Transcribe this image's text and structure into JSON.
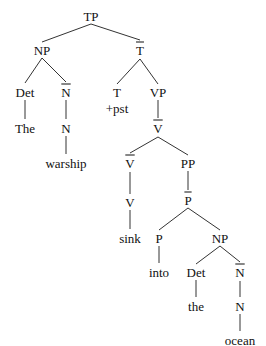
{
  "diagram": {
    "type": "syntax-tree",
    "sentence": "The warship sink +pst into the ocean",
    "nodes": [
      {
        "id": "tp",
        "label": "TP",
        "bar": false,
        "x": 91,
        "y": 16
      },
      {
        "id": "np1",
        "label": "NP",
        "bar": false,
        "x": 42,
        "y": 50
      },
      {
        "id": "tbar",
        "label": "T",
        "bar": true,
        "x": 140,
        "y": 50
      },
      {
        "id": "det1",
        "label": "Det",
        "bar": false,
        "x": 25,
        "y": 92
      },
      {
        "id": "nbar1",
        "label": "N",
        "bar": true,
        "x": 66,
        "y": 92
      },
      {
        "id": "t",
        "label": "T",
        "bar": false,
        "x": 117,
        "y": 92
      },
      {
        "id": "pst",
        "label": "+pst",
        "bar": false,
        "x": 117,
        "y": 108
      },
      {
        "id": "vp",
        "label": "VP",
        "bar": false,
        "x": 158,
        "y": 92
      },
      {
        "id": "the1",
        "label": "The",
        "bar": false,
        "x": 25,
        "y": 128
      },
      {
        "id": "n1",
        "label": "N",
        "bar": false,
        "x": 66,
        "y": 128
      },
      {
        "id": "vbar1",
        "label": "V",
        "bar": true,
        "x": 158,
        "y": 128
      },
      {
        "id": "warship",
        "label": "warship",
        "bar": false,
        "x": 66,
        "y": 163
      },
      {
        "id": "vbar2",
        "label": "V",
        "bar": true,
        "x": 130,
        "y": 163
      },
      {
        "id": "pp",
        "label": "PP",
        "bar": false,
        "x": 188,
        "y": 163
      },
      {
        "id": "v",
        "label": "V",
        "bar": false,
        "x": 130,
        "y": 202
      },
      {
        "id": "pbar",
        "label": "P",
        "bar": true,
        "x": 188,
        "y": 200
      },
      {
        "id": "sink",
        "label": "sink",
        "bar": false,
        "x": 130,
        "y": 238
      },
      {
        "id": "p",
        "label": "P",
        "bar": false,
        "x": 159,
        "y": 238
      },
      {
        "id": "np2",
        "label": "NP",
        "bar": false,
        "x": 220,
        "y": 238
      },
      {
        "id": "into",
        "label": "into",
        "bar": false,
        "x": 159,
        "y": 272
      },
      {
        "id": "det2",
        "label": "Det",
        "bar": false,
        "x": 196,
        "y": 272
      },
      {
        "id": "nbar2",
        "label": "N",
        "bar": true,
        "x": 240,
        "y": 272
      },
      {
        "id": "the2",
        "label": "the",
        "bar": false,
        "x": 196,
        "y": 306
      },
      {
        "id": "n2",
        "label": "N",
        "bar": false,
        "x": 240,
        "y": 306
      },
      {
        "id": "ocean",
        "label": "ocean",
        "bar": false,
        "x": 240,
        "y": 340
      }
    ],
    "edges": [
      {
        "x1": 91,
        "y1": 24,
        "x2": 42,
        "y2": 42
      },
      {
        "x1": 91,
        "y1": 24,
        "x2": 140,
        "y2": 40
      },
      {
        "x1": 42,
        "y1": 58,
        "x2": 25,
        "y2": 83
      },
      {
        "x1": 42,
        "y1": 58,
        "x2": 66,
        "y2": 82
      },
      {
        "x1": 140,
        "y1": 59,
        "x2": 117,
        "y2": 84
      },
      {
        "x1": 140,
        "y1": 59,
        "x2": 158,
        "y2": 84
      },
      {
        "x1": 25,
        "y1": 100,
        "x2": 25,
        "y2": 119
      },
      {
        "x1": 66,
        "y1": 100,
        "x2": 66,
        "y2": 119
      },
      {
        "x1": 158,
        "y1": 100,
        "x2": 158,
        "y2": 118
      },
      {
        "x1": 66,
        "y1": 136,
        "x2": 66,
        "y2": 154
      },
      {
        "x1": 158,
        "y1": 137,
        "x2": 130,
        "y2": 153
      },
      {
        "x1": 158,
        "y1": 137,
        "x2": 188,
        "y2": 155
      },
      {
        "x1": 130,
        "y1": 172,
        "x2": 130,
        "y2": 194
      },
      {
        "x1": 188,
        "y1": 171,
        "x2": 188,
        "y2": 190
      },
      {
        "x1": 130,
        "y1": 210,
        "x2": 130,
        "y2": 229
      },
      {
        "x1": 188,
        "y1": 208,
        "x2": 159,
        "y2": 230
      },
      {
        "x1": 188,
        "y1": 208,
        "x2": 220,
        "y2": 230
      },
      {
        "x1": 159,
        "y1": 246,
        "x2": 159,
        "y2": 263
      },
      {
        "x1": 220,
        "y1": 246,
        "x2": 196,
        "y2": 264
      },
      {
        "x1": 220,
        "y1": 246,
        "x2": 240,
        "y2": 262
      },
      {
        "x1": 196,
        "y1": 280,
        "x2": 196,
        "y2": 297
      },
      {
        "x1": 240,
        "y1": 281,
        "x2": 240,
        "y2": 297
      },
      {
        "x1": 240,
        "y1": 314,
        "x2": 240,
        "y2": 331
      }
    ],
    "colors": {
      "line": "#333333",
      "text": "#111111",
      "background": "#ffffff"
    }
  }
}
